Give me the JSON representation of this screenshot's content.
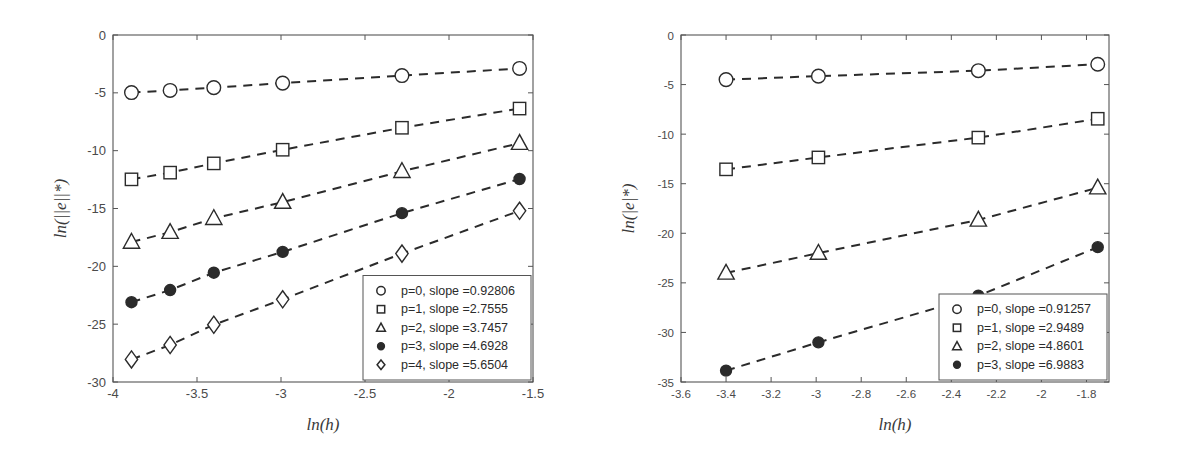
{
  "figure": {
    "background": "#ffffff",
    "line_color": "#2b2b2b",
    "axis_color": "#555555",
    "text_color": "#3a3a3a"
  },
  "chart_data": [
    {
      "type": "line",
      "panel": "left",
      "title": "",
      "xlabel": "ln(h)",
      "ylabel": "ln(||e||*)",
      "xlim": [
        -4.0,
        -1.5
      ],
      "ylim": [
        -30,
        0
      ],
      "xticks": [
        -4,
        -3.5,
        -3,
        -2.5,
        -2,
        -1.5
      ],
      "xticklabels": [
        "-4",
        "-3.5",
        "-3",
        "-2.5",
        "-2",
        "-1.5"
      ],
      "yticks": [
        -30,
        -25,
        -20,
        -15,
        -10,
        -5,
        0
      ],
      "yticklabels": [
        "-30",
        "-25",
        "-20",
        "-15",
        "-10",
        "-5",
        "0"
      ],
      "grid": false,
      "linestyle": "dashed",
      "legend_position": "lower right",
      "x": [
        -3.89,
        -3.66,
        -3.4,
        -2.99,
        -2.28,
        -1.58
      ],
      "series": [
        {
          "name": "p=0, slope =0.92806",
          "marker": "circle-open",
          "slope": 0.92806,
          "values": [
            -4.98,
            -4.79,
            -4.55,
            -4.16,
            -3.51,
            -2.89
          ]
        },
        {
          "name": "p=1, slope =2.7555",
          "marker": "square-open",
          "slope": 2.7555,
          "values": [
            -12.48,
            -11.9,
            -11.1,
            -9.92,
            -8.02,
            -6.36
          ]
        },
        {
          "name": "p=2, slope =3.7457",
          "marker": "triangle-open",
          "slope": 3.7457,
          "values": [
            -17.9,
            -17.05,
            -15.85,
            -14.45,
            -11.78,
            -9.35
          ]
        },
        {
          "name": "p=3, slope =4.6928",
          "marker": "circle-filled",
          "slope": 4.6928,
          "values": [
            -23.1,
            -22.05,
            -20.55,
            -18.75,
            -15.4,
            -12.45
          ]
        },
        {
          "name": "p=4, slope =5.6504",
          "marker": "diamond-open",
          "slope": 5.6504,
          "values": [
            -28.05,
            -26.8,
            -25.05,
            -22.85,
            -18.9,
            -15.2
          ]
        }
      ]
    },
    {
      "type": "line",
      "panel": "right",
      "title": "",
      "xlabel": "ln(h)",
      "ylabel": "ln(|e|*)",
      "xlim": [
        -3.6,
        -1.7
      ],
      "ylim": [
        -35,
        0
      ],
      "xticks": [
        -3.6,
        -3.4,
        -3.2,
        -3,
        -2.8,
        -2.6,
        -2.4,
        -2.2,
        -2,
        -1.8
      ],
      "xticklabels": [
        "-3.6",
        "-3.4",
        "-3.2",
        "-3",
        "-2.8",
        "-2.6",
        "-2.4",
        "-2.2",
        "-2",
        "-1.8"
      ],
      "yticks": [
        -35,
        -30,
        -25,
        -20,
        -15,
        -10,
        -5,
        0
      ],
      "yticklabels": [
        "-35",
        "-30",
        "-25",
        "-20",
        "-15",
        "-10",
        "-5",
        "0"
      ],
      "grid": false,
      "linestyle": "dashed",
      "legend_position": "lower right",
      "x": [
        -3.4,
        -2.99,
        -2.28,
        -1.75
      ],
      "series": [
        {
          "name": "p=0, slope =0.91257",
          "marker": "circle-open",
          "slope": 0.91257,
          "values": [
            -4.5,
            -4.15,
            -3.6,
            -2.95
          ]
        },
        {
          "name": "p=1, slope =2.9489",
          "marker": "square-open",
          "slope": 2.9489,
          "values": [
            -13.55,
            -12.35,
            -10.35,
            -8.45
          ]
        },
        {
          "name": "p=2, slope =4.8601",
          "marker": "triangle-open",
          "slope": 4.8601,
          "values": [
            -24.0,
            -22.0,
            -18.65,
            -15.4
          ]
        },
        {
          "name": "p=3, slope =6.9883",
          "marker": "circle-filled",
          "slope": 6.9883,
          "values": [
            -33.85,
            -31.0,
            -26.3,
            -21.4
          ]
        }
      ]
    }
  ]
}
